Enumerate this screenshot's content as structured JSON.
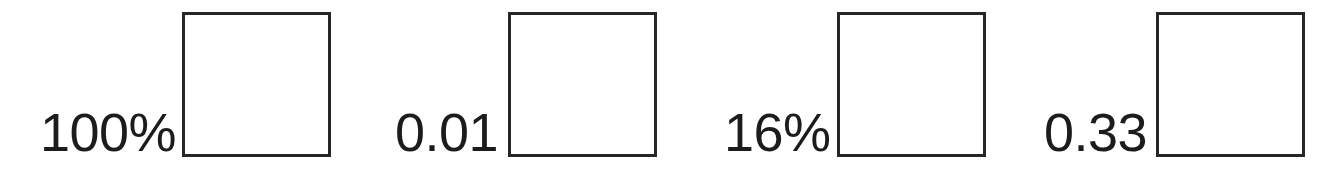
{
  "figure": {
    "kind": "scale-legend-strip",
    "background_color": "#ffffff",
    "swatch_fill_color": "#ffffff",
    "swatch_border_color": "#262626",
    "swatch_border_width_px": 3,
    "label_color": "#1c1c1c",
    "label_font_size_px": 54,
    "canvas": {
      "width_px": 1335,
      "height_px": 182
    }
  },
  "items": [
    {
      "label": "100%",
      "label_left_px": 40,
      "pair_left_px": 40,
      "pair_bottom_px": 25,
      "label_gap_px": 6,
      "swatch": {
        "width_px": 149,
        "height_px": 145,
        "left_px": 183,
        "top_px": 12
      }
    },
    {
      "label": "0.01",
      "label_left_px": 395,
      "pair_left_px": 395,
      "pair_bottom_px": 25,
      "label_gap_px": 10,
      "swatch": {
        "width_px": 149,
        "height_px": 145,
        "left_px": 508,
        "top_px": 12
      }
    },
    {
      "label": "16%",
      "label_left_px": 724,
      "pair_left_px": 724,
      "pair_bottom_px": 25,
      "label_gap_px": 6,
      "swatch": {
        "width_px": 149,
        "height_px": 145,
        "left_px": 834,
        "top_px": 12
      }
    },
    {
      "label": "0.33",
      "label_left_px": 1044,
      "pair_left_px": 1044,
      "pair_bottom_px": 25,
      "label_gap_px": 9,
      "swatch": {
        "width_px": 149,
        "height_px": 145,
        "left_px": 1159,
        "top_px": 12
      }
    }
  ],
  "chart_data": {
    "type": "table",
    "title": "",
    "xlabel": "",
    "ylabel": "",
    "categories": [
      "100%",
      "0.01",
      "16%",
      "0.33"
    ],
    "values": [
      100,
      0.01,
      16,
      0.33
    ],
    "annotations": [
      "100% paired with empty square swatch",
      "0.01 paired with empty square swatch",
      "16% paired with empty square swatch",
      "0.33 paired with empty square swatch"
    ],
    "legend_position": "inline-row",
    "grid": false
  }
}
